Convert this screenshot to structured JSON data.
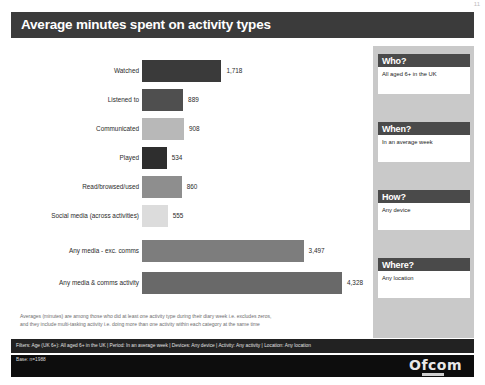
{
  "header": {
    "title": "Average minutes spent on activity types",
    "page_number": "11"
  },
  "chart_data": {
    "type": "bar",
    "orientation": "horizontal",
    "title": "Average minutes spent on activity types",
    "xlabel": "",
    "ylabel": "",
    "xlim": [
      0,
      4328
    ],
    "grid": false,
    "legend": "none",
    "categories": [
      "Watched",
      "Listened to",
      "Communicated",
      "Played",
      "Read/browsed/used",
      "Social media (across activities)",
      "Any media - exc. comms",
      "Any media & comms activity"
    ],
    "values": [
      1718,
      889,
      908,
      534,
      860,
      555,
      3497,
      4328
    ],
    "value_labels": [
      "1,718",
      "889",
      "908",
      "534",
      "860",
      "555",
      "3,497",
      "4,328"
    ],
    "colors": [
      "#3a3a3a",
      "#4f4f4f",
      "#b8b8b8",
      "#2e2e2e",
      "#8e8e8e",
      "#dcdcdc",
      "#7d7d7d",
      "#696969"
    ]
  },
  "footnote": {
    "line1": "Averages (minutes) are among those who did at least one activity type during their diary week i.e. excludes zeros,",
    "line2": "and they include multi-tasking activity i.e. doing more than one activity within each category at the same time"
  },
  "sidebar": {
    "panels": [
      {
        "heading": "Who?",
        "body": "All aged 6+ in the UK"
      },
      {
        "heading": "When?",
        "body": "In an average week"
      },
      {
        "heading": "How?",
        "body": "Any device"
      },
      {
        "heading": "Where?",
        "body": "Any location"
      }
    ]
  },
  "filters": {
    "text": "Filters: Age (UK 6+): All aged 6+ in the UK | Period: In an average week | Devices: Any device  | Activity: Any activity | Location: Any location"
  },
  "footer": {
    "base": "Base: n=1988",
    "logo": "Ofcom"
  }
}
